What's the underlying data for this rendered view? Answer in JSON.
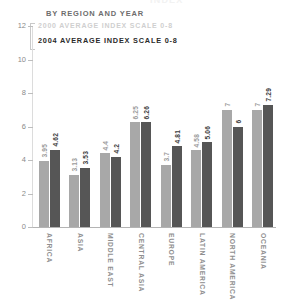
{
  "header": {
    "cropped_title": "INDEX",
    "subtitle": "BY REGION AND YEAR"
  },
  "legend": {
    "items": [
      {
        "label": "2000 AVERAGE INDEX SCALE 0-8",
        "color": "#a8a8a8"
      },
      {
        "label": "2004 AVERAGE INDEX SCALE 0-8",
        "color": "#565656"
      }
    ]
  },
  "axis": {
    "y_ticks": [
      "0",
      "2",
      "4",
      "6",
      "8",
      "10",
      "12"
    ]
  },
  "chart_data": {
    "type": "bar",
    "title": "BY REGION AND YEAR",
    "xlabel": "",
    "ylabel": "",
    "ylim": [
      0,
      12
    ],
    "ytick_step": 2,
    "grid": false,
    "legend_position": "top-left",
    "categories": [
      "AFRICA",
      "ASIA",
      "MIDDLE EAST",
      "CENTRAL ASIA",
      "EUROPE",
      "LATIN AMERICA",
      "NORTH AMERICA",
      "OCEANIA"
    ],
    "series": [
      {
        "name": "2000 AVERAGE INDEX SCALE 0-8",
        "color": "#a8a8a8",
        "values": [
          3.95,
          3.13,
          4.4,
          6.25,
          3.7,
          4.58,
          7,
          7
        ],
        "labels": [
          "3.95",
          "3.13",
          "4.4",
          "6.25",
          "3.7",
          "4.58",
          "7",
          "7"
        ]
      },
      {
        "name": "2004 AVERAGE INDEX SCALE 0-8",
        "color": "#565656",
        "values": [
          4.62,
          3.53,
          4.2,
          6.26,
          4.81,
          5.06,
          6,
          7.29
        ],
        "labels": [
          "4.62",
          "3.53",
          "4.2",
          "6.26",
          "4.81",
          "5.06",
          "6",
          "7.29"
        ]
      }
    ]
  }
}
